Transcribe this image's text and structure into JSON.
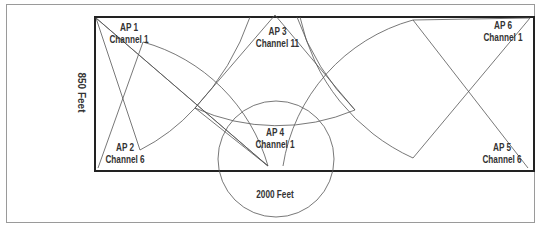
{
  "diagram": {
    "dimensions": {
      "height_label": "850 Feet",
      "width_label": "2000 Feet"
    },
    "access_points": [
      {
        "name": "AP 1",
        "channel": "Channel 1"
      },
      {
        "name": "AP 2",
        "channel": "Channel 6"
      },
      {
        "name": "AP 3",
        "channel": "Channel 11"
      },
      {
        "name": "AP 4",
        "channel": "Channel 1"
      },
      {
        "name": "AP 5",
        "channel": "Channel 6"
      },
      {
        "name": "AP 6",
        "channel": "Channel 1"
      }
    ]
  }
}
